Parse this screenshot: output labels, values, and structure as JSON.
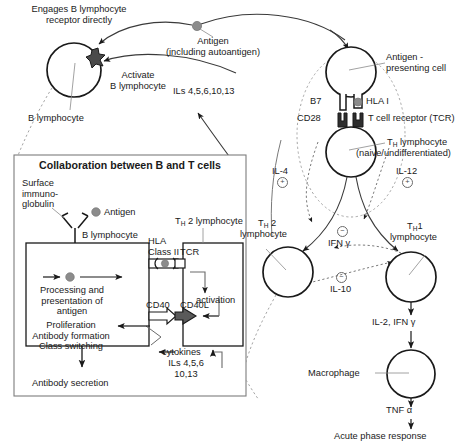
{
  "figure": {
    "title_inset": "Collaboration between B and T cells",
    "palette": {
      "stroke": "#1a1a1a",
      "dashed_guide": "#9a9a9a",
      "antigen_dot": "#8c8c8c",
      "receptor_dark": "#3d3d3d",
      "cd40l_fill": "#5a5a5a",
      "background": "#ffffff"
    }
  },
  "top_left": {
    "engages_label": "Engages B lymphocyte\nreceptor directly",
    "activate_label": "Activate\nB lymphocyte",
    "b_lymphocyte_label": "B lymphocyte"
  },
  "antigen": {
    "name": "Antigen",
    "qualifier": "(including autoantigen)"
  },
  "interleukins": {
    "top_ils_label": "ILs 4,5,6,10,13"
  },
  "apc": {
    "label": "Antigen -\npresenting cell",
    "b7": "B7",
    "hla_i": "HLA I",
    "cd28": "CD28",
    "tcr": "T cell receptor (TCR)"
  },
  "th_naive": {
    "label_main": "T",
    "label_sub": "H",
    "label_rest": " lymphocyte",
    "label_qualifier": "(naive/undifferentiated)"
  },
  "cytokine_signals": {
    "il4": {
      "label": "IL-4",
      "sign": "+"
    },
    "il12": {
      "label": "IL-12",
      "sign": "+"
    },
    "ifn_gamma": {
      "label": "IFN γ",
      "sign": "−"
    },
    "il10": {
      "label": "IL-10",
      "sign": "−"
    }
  },
  "th2": {
    "label_main": "T",
    "label_sub": "H",
    "label_num": " 2",
    "label_rest": "lymphocyte"
  },
  "th1": {
    "label_main": "T",
    "label_sub": "H",
    "label_num": "1",
    "label_rest": "lymphocyte"
  },
  "effector_chain": {
    "il2_ifn": "IL-2, IFN γ",
    "macrophage": "Macrophage",
    "tnf_alpha": "TNF α",
    "acute_phase": "Acute phase response"
  },
  "inset": {
    "title": "Collaboration between B and T cells",
    "surface_ig": "Surface\nimmuno-\nglobulin",
    "antigen": "Antigen",
    "b_lymphocyte": "B lymphocyte",
    "hla_class_ii": "HLA\nClass II",
    "tcr": "TCR",
    "th2_lymphocyte_main": "T",
    "th2_lymphocyte_sub": "H",
    "th2_lymphocyte_rest": " 2 lymphocyte",
    "processing": "Processing and\npresentation of\nantigen",
    "cd40": "CD40",
    "cd40l": "CD40L",
    "activation": "activation",
    "outcomes": "Proliferation\nAntibody formation\nClass switching",
    "cytokines": "cytokines",
    "cytokine_ils": "ILs 4,5,6\n10,13",
    "antibody_secretion": "Antibody secretion"
  }
}
